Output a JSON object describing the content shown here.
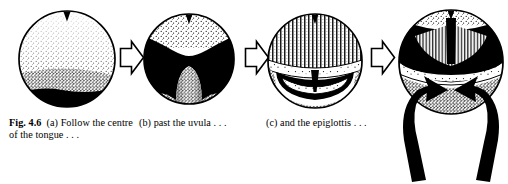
{
  "figure": {
    "label": "Fig. 4.6",
    "panels": [
      {
        "id": "a",
        "marker": "(a)",
        "caption": "(a) Follow the centre of the tongue . . .",
        "caption_text": "Follow the centre of the tongue . . .",
        "view": "tongue-surface-view",
        "alt": "Laryngoscope view of the stippled dorsal surface of the tongue with a dark notch at the top and a black shadowed region along the lower margin"
      },
      {
        "id": "b",
        "marker": "(b)",
        "caption": "(b) past the uvula . . .",
        "caption_text": "past the uvula . . .",
        "view": "uvula-view",
        "alt": "Laryngoscope view showing the pale dome of the uvula rising from the lower field into a black oropharyngeal space"
      },
      {
        "id": "c",
        "marker": "(c)",
        "caption": "(c) and the epiglottis . . .",
        "caption_text": "and the epiglottis . . .",
        "view": "epiglottis-view",
        "alt": "Laryngoscope view of the striated posterior tongue above the curved rim of the epiglottis with a dark slit beneath"
      },
      {
        "id": "d",
        "marker": "",
        "caption": "",
        "caption_text": "",
        "view": "vocal-cords-view",
        "alt": "Laryngoscope view of the vocal cords forming a dark triangular glottic opening, with two heavy black arrows sweeping in from below"
      }
    ],
    "connectors": [
      {
        "name": "step-arrow-a-to-b",
        "style": "hollow-outline-arrow",
        "direction": "right"
      },
      {
        "name": "step-arrow-b-to-c",
        "style": "hollow-outline-arrow",
        "direction": "right"
      },
      {
        "name": "step-arrow-c-to-d",
        "style": "hollow-outline-arrow",
        "direction": "right"
      }
    ],
    "pointer_arrows": [
      {
        "name": "cord-arrow-left",
        "style": "solid-black-ribbon-arrow",
        "direction": "up-right"
      },
      {
        "name": "cord-arrow-right",
        "style": "solid-black-ribbon-arrow",
        "direction": "up-left"
      }
    ]
  },
  "colors": {
    "ink": "#000000",
    "paper": "#ffffff",
    "stipple": "#1a1a1a"
  }
}
